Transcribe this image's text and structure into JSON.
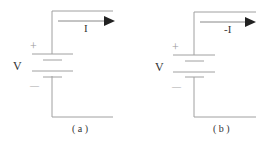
{
  "diagram": {
    "type": "circuit",
    "colors": {
      "wire": "#9a9a9a",
      "arrow": "#222222",
      "text": "#333333"
    },
    "panels": [
      {
        "id": "a",
        "caption": "( a )",
        "voltage_label": "V",
        "plus_label": "+",
        "minus_label": "—",
        "current_label": "I"
      },
      {
        "id": "b",
        "caption": "( b )",
        "voltage_label": "V",
        "plus_label": "+",
        "minus_label": "—",
        "current_label": "-I"
      }
    ]
  }
}
